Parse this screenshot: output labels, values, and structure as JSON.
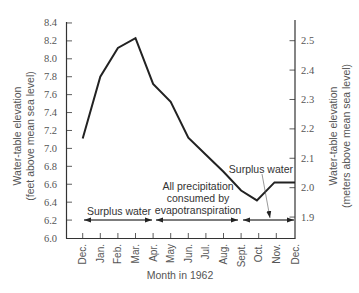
{
  "chart_data": {
    "type": "line",
    "title": "",
    "xlabel": "Month in 1962",
    "ylabel": "Water-table elevation (feet above mean sea level)",
    "ylabel_lines": [
      "Water-table elevation",
      "(feet above mean sea level)"
    ],
    "y2label": "Water-table elevation (meters above mean sea level)",
    "y2label_lines": [
      "Water-table elevation",
      "(meters above mean sea level)"
    ],
    "categories": [
      "Dec.",
      "Jan.",
      "Feb.",
      "Mar.",
      "Apr.",
      "May",
      "Jun.",
      "Jul.",
      "Aug.",
      "Sept.",
      "Oct.",
      "Nov.",
      "Dec."
    ],
    "series": [
      {
        "name": "Water-table elevation (ft)",
        "points": [
          {
            "month": "Dec.",
            "value": 7.11
          },
          {
            "month": "Jan.",
            "value": 7.8
          },
          {
            "month": "Feb.",
            "value": 8.12
          },
          {
            "month": "Mar.",
            "value": 8.23
          },
          {
            "month": "Apr.",
            "value": 7.72
          },
          {
            "month": "May",
            "value": 7.52
          },
          {
            "month": "Jun.",
            "value": 7.12
          },
          {
            "month": "Jul.",
            "value": 6.93
          },
          {
            "month": "Aug.",
            "value": 6.74
          },
          {
            "month": "Sept.",
            "value": 6.53
          },
          {
            "month": "Oct.",
            "value": 6.42
          },
          {
            "month": "Nov.",
            "value": 6.62
          },
          {
            "month": "Dec.",
            "value": 6.62
          }
        ],
        "x_index": [
          0,
          1,
          2,
          3,
          4,
          5,
          6,
          7,
          8,
          9,
          9.9,
          10.9,
          12
        ],
        "values": [
          7.11,
          7.8,
          8.12,
          8.23,
          7.72,
          7.52,
          7.12,
          6.93,
          6.74,
          6.53,
          6.42,
          6.62,
          6.62
        ]
      }
    ],
    "ylim": [
      6.0,
      8.4
    ],
    "yticks": [
      "6.0",
      "6.2",
      "6.4",
      "6.6",
      "6.8",
      "7.0",
      "7.2",
      "7.4",
      "7.6",
      "7.8",
      "8.0",
      "8.2",
      "8.4"
    ],
    "y2ticks": [
      "1.9",
      "2.0",
      "2.1",
      "2.2",
      "2.3",
      "2.4",
      "2.5"
    ],
    "y2_unit": "meters",
    "annotations": [
      {
        "text": "Surplus water",
        "span": [
          "Dec.",
          "Apr."
        ],
        "type": "double-arrow"
      },
      {
        "text": "All precipitation consumed by evapotranspiration",
        "lines": [
          "All precipitation",
          "consumed by",
          "evapotranspiration"
        ],
        "span": [
          "Apr.",
          "Sept."
        ],
        "type": "double-arrow"
      },
      {
        "text": "Surplus water",
        "span": [
          "Sept.",
          "Dec."
        ],
        "type": "double-arrow",
        "callout": true
      }
    ],
    "grid": false,
    "legend": null
  }
}
